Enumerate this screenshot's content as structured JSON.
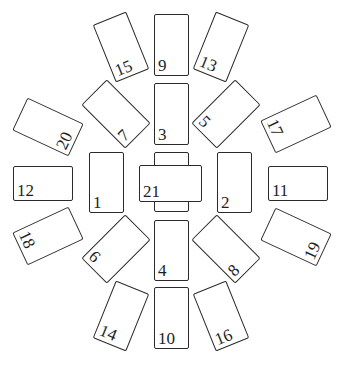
{
  "cards": [
    {
      "label": "9",
      "cx": 171.5,
      "cy": 45,
      "w": 35,
      "h": 62,
      "rot": 0
    },
    {
      "label": "3",
      "cx": 171.5,
      "cy": 114,
      "w": 35,
      "h": 62,
      "rot": 0
    },
    {
      "label": "4",
      "cx": 171.5,
      "cy": 250,
      "w": 35,
      "h": 61,
      "rot": 0
    },
    {
      "label": "10",
      "cx": 171.5,
      "cy": 318,
      "w": 35,
      "h": 62,
      "rot": 0
    },
    {
      "label": "1",
      "cx": 106.5,
      "cy": 182,
      "w": 35,
      "h": 61,
      "rot": 0
    },
    {
      "label": "2",
      "cx": 234.5,
      "cy": 182,
      "w": 35,
      "h": 61,
      "rot": 0
    },
    {
      "label": "12",
      "cx": 43,
      "cy": 183,
      "w": 60,
      "h": 35,
      "rot": 0
    },
    {
      "label": "11",
      "cx": 298,
      "cy": 183,
      "w": 60,
      "h": 35,
      "rot": 0
    },
    {
      "label": "15",
      "cx": 121,
      "cy": 47,
      "w": 36,
      "h": 62,
      "rot": -22
    },
    {
      "label": "13",
      "cx": 221,
      "cy": 47,
      "w": 36,
      "h": 62,
      "rot": 22
    },
    {
      "label": "7",
      "cx": 116,
      "cy": 114,
      "w": 36,
      "h": 62,
      "rot": -45
    },
    {
      "label": "5",
      "cx": 226,
      "cy": 114,
      "w": 36,
      "h": 62,
      "rot": 45
    },
    {
      "label": "20",
      "cx": 48,
      "cy": 127,
      "w": 36,
      "h": 62,
      "rot": -65
    },
    {
      "label": "17",
      "cx": 296,
      "cy": 124,
      "w": 36,
      "h": 62,
      "rot": 65
    },
    {
      "label": "18",
      "cx": 48,
      "cy": 236,
      "w": 36,
      "h": 62,
      "rot": 65
    },
    {
      "label": "19",
      "cx": 296,
      "cy": 237,
      "w": 36,
      "h": 62,
      "rot": -65
    },
    {
      "label": "6",
      "cx": 116,
      "cy": 249,
      "w": 36,
      "h": 62,
      "rot": 45
    },
    {
      "label": "8",
      "cx": 226,
      "cy": 249,
      "w": 36,
      "h": 62,
      "rot": -45
    },
    {
      "label": "14",
      "cx": 121,
      "cy": 316,
      "w": 36,
      "h": 62,
      "rot": 22
    },
    {
      "label": "16",
      "cx": 221,
      "cy": 316,
      "w": 36,
      "h": 62,
      "rot": -22
    }
  ],
  "center": {
    "label": "21",
    "vertical": {
      "cx": 171.5,
      "cy": 182,
      "w": 35,
      "h": 60
    },
    "horizontal": {
      "cx": 170.5,
      "cy": 183.5,
      "w": 63,
      "h": 37
    }
  },
  "colors": {
    "line": "#2a2a2a",
    "text": "#1e1e1e",
    "background": "#ffffff"
  }
}
